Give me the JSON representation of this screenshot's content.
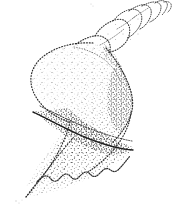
{
  "figure": {
    "subject_name": "spindle shell",
    "view": "apertural view",
    "technique": "stipple and line drawing",
    "orientation": "apex upper-right, siphonal canal lower-left",
    "background_color": "#ffffff",
    "ink_color": "#2b2b2b",
    "stipple_color": "#3a3a3a",
    "canvas": {
      "width": 181,
      "height": 224
    },
    "parts": [
      {
        "name": "apex",
        "label": "apex"
      },
      {
        "name": "spire",
        "label": "spire"
      },
      {
        "name": "suture",
        "label": "suture"
      },
      {
        "name": "body-whorl",
        "label": "body whorl"
      },
      {
        "name": "shoulder",
        "label": "shoulder"
      },
      {
        "name": "aperture",
        "label": "aperture"
      },
      {
        "name": "columella",
        "label": "columella"
      },
      {
        "name": "outer-lip",
        "label": "outer lip"
      },
      {
        "name": "crenulated-margin",
        "label": "crenulated margin"
      },
      {
        "name": "siphonal-canal",
        "label": "siphonal canal"
      }
    ],
    "spire_whorl_count": 6,
    "margin_scallop_count": 6,
    "caption": ""
  }
}
